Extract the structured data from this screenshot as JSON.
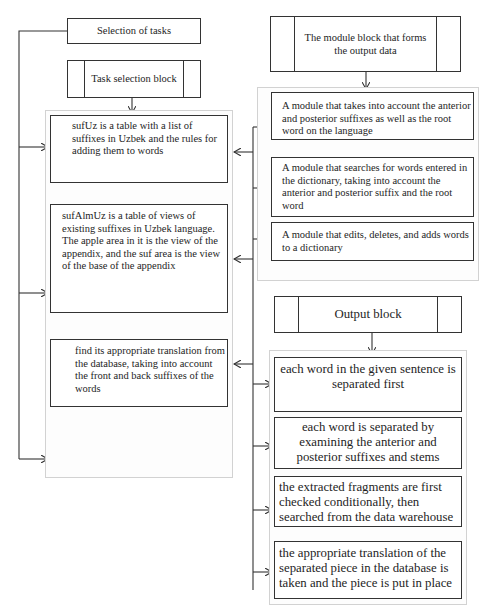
{
  "left": {
    "selection": "Selection of tasks",
    "task_block": "Task selection block",
    "items": [
      {
        "text": "sufUz is a table with a list of suffixes in Uzbek and the rules for adding them to words"
      },
      {
        "text": "sufAlmUz is a table of views of existing suffixes in Uzbek language. The apple area in it is the view of the appendix, and the suf area is the view of the base of the appendix"
      },
      {
        "text": "find its appropriate translation from the database, taking into account the front and back suffixes of the words"
      }
    ]
  },
  "right": {
    "module_block": "The module block that forms the output data",
    "modules": [
      {
        "text": "A module that takes into account the anterior and posterior suffixes as well as the root word on the language"
      },
      {
        "text": "A module that searches for words entered in the dictionary, taking into account the anterior and posterior suffix and the root word"
      },
      {
        "text": "A module that edits, deletes, and adds words to a dictionary"
      }
    ],
    "output_block": "Output block",
    "steps": [
      {
        "text": "each word in the given sentence is separated first"
      },
      {
        "text": "each word is separated by examining the anterior and posterior suffixes and stems"
      },
      {
        "text": "the extracted fragments are first checked conditionally, then searched from the data warehouse"
      },
      {
        "text": "the appropriate translation of the separated piece in the database is taken and the piece is put in place"
      }
    ]
  },
  "colors": {
    "line": "#333333",
    "group_border": "#d2d2d2",
    "background": "#ffffff"
  }
}
